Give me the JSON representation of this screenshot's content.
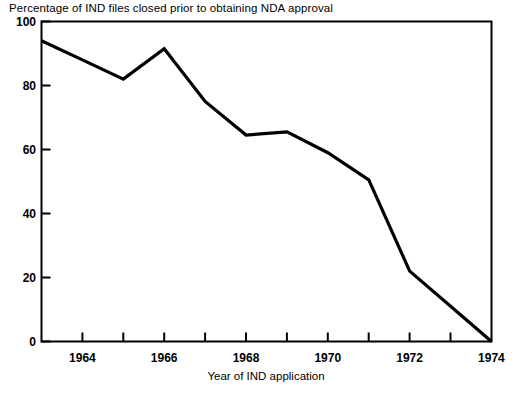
{
  "chart_data": {
    "type": "line",
    "title": "Percentage of IND files closed prior to obtaining NDA approval",
    "xlabel": "Year of IND application",
    "ylabel": "",
    "x": [
      1963,
      1964,
      1965,
      1966,
      1967,
      1968,
      1969,
      1970,
      1971,
      1972,
      1973,
      1974
    ],
    "values": [
      94,
      88,
      82,
      91.5,
      75,
      64.5,
      65.5,
      59,
      50.5,
      22,
      11,
      0
    ],
    "series": [
      {
        "name": "Percentage of IND files closed prior to obtaining NDA approval",
        "values": [
          94,
          88,
          82,
          91.5,
          75,
          64.5,
          65.5,
          59,
          50.5,
          22,
          11,
          0
        ]
      }
    ],
    "xlim": [
      1963,
      1974
    ],
    "ylim": [
      0,
      100
    ],
    "xticks": [
      1963,
      1964,
      1965,
      1966,
      1967,
      1968,
      1969,
      1970,
      1971,
      1972,
      1973,
      1974
    ],
    "xtick_labels": [
      "",
      "1964",
      "",
      "1966",
      "",
      "1968",
      "",
      "1970",
      "",
      "1972",
      "",
      "1974"
    ],
    "yticks": [
      0,
      20,
      40,
      60,
      80,
      100
    ],
    "ytick_labels": [
      "0",
      "20",
      "40",
      "60",
      "80",
      "100"
    ],
    "grid": false,
    "legend": null,
    "line_color": "#000000",
    "line_width": 3.2,
    "frame_color": "#000000",
    "background_color": "#ffffff"
  },
  "axes": {
    "y_ticks": [
      {
        "label": "100",
        "value": 100
      },
      {
        "label": "80",
        "value": 80
      },
      {
        "label": "60",
        "value": 60
      },
      {
        "label": "40",
        "value": 40
      },
      {
        "label": "20",
        "value": 20
      },
      {
        "label": "0",
        "value": 0
      }
    ],
    "x_ticks": [
      {
        "label": "1964",
        "value": 1964
      },
      {
        "label": "1966",
        "value": 1966
      },
      {
        "label": "1968",
        "value": 1968
      },
      {
        "label": "1970",
        "value": 1970
      },
      {
        "label": "1972",
        "value": 1972
      },
      {
        "label": "1974",
        "value": 1974
      }
    ]
  }
}
